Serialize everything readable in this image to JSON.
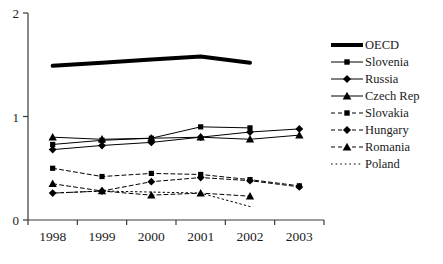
{
  "chart_data": {
    "type": "line",
    "title": "",
    "xlabel": "",
    "ylabel": "",
    "categories": [
      "1998",
      "1999",
      "2000",
      "2001",
      "2002",
      "2003"
    ],
    "ylim": [
      0,
      2
    ],
    "yticks": [
      0,
      1,
      2
    ],
    "ytick_labels": [
      "0",
      "1",
      "2"
    ],
    "grid": false,
    "legend_position": "right",
    "series": [
      {
        "name": "OECD",
        "line_style": "solid",
        "line_width": 4,
        "marker": "none",
        "values": [
          1.49,
          1.52,
          1.55,
          1.58,
          1.52,
          null
        ]
      },
      {
        "name": "Slovenia",
        "line_style": "solid",
        "line_width": 1,
        "marker": "square",
        "values": [
          0.73,
          0.77,
          0.79,
          0.9,
          0.89,
          null
        ]
      },
      {
        "name": "Russia",
        "line_style": "solid",
        "line_width": 1,
        "marker": "diamond",
        "values": [
          0.68,
          0.72,
          0.75,
          0.8,
          0.85,
          0.88
        ]
      },
      {
        "name": "Czech Rep",
        "line_style": "solid",
        "line_width": 1,
        "marker": "triangle",
        "values": [
          0.8,
          0.78,
          0.79,
          0.8,
          0.78,
          0.82
        ]
      },
      {
        "name": "Slovakia",
        "line_style": "dashed",
        "line_width": 1,
        "marker": "square",
        "values": [
          0.5,
          0.42,
          0.45,
          0.44,
          0.39,
          0.33
        ]
      },
      {
        "name": "Hungary",
        "line_style": "dashed",
        "line_width": 1,
        "marker": "diamond",
        "values": [
          0.26,
          0.28,
          0.37,
          0.41,
          0.38,
          0.32
        ]
      },
      {
        "name": "Romania",
        "line_style": "dashed",
        "line_width": 1,
        "marker": "triangle",
        "values": [
          0.35,
          0.28,
          0.24,
          0.26,
          0.23,
          null
        ]
      },
      {
        "name": "Poland",
        "line_style": "dotted",
        "line_width": 1,
        "marker": "none",
        "values": [
          0.26,
          0.28,
          0.27,
          0.26,
          0.13,
          null
        ]
      }
    ]
  },
  "axes": {
    "y_top_label": "2",
    "y_mid_label": "1",
    "y_bottom_label": "0",
    "x_labels": [
      "1998",
      "1999",
      "2000",
      "2001",
      "2002",
      "2003"
    ],
    "axis_color": "#3a3a3a"
  },
  "legend": {
    "items": [
      {
        "label": "OECD",
        "marker": "none",
        "style": "solid-thick"
      },
      {
        "label": "Slovenia",
        "marker": "square",
        "style": "solid"
      },
      {
        "label": "Russia",
        "marker": "diamond",
        "style": "solid"
      },
      {
        "label": "Czech Rep",
        "marker": "triangle",
        "style": "solid"
      },
      {
        "label": "Slovakia",
        "marker": "square",
        "style": "dashed"
      },
      {
        "label": "Hungary",
        "marker": "diamond",
        "style": "dashed"
      },
      {
        "label": "Romania",
        "marker": "triangle",
        "style": "dashed"
      },
      {
        "label": "Poland",
        "marker": "none",
        "style": "dotted"
      }
    ]
  },
  "colors": {
    "series": "#000000",
    "axis": "#3a3a3a",
    "background": "#ffffff",
    "text": "#1a1a1a"
  }
}
